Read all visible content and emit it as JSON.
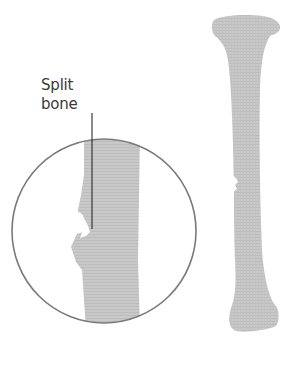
{
  "figure": {
    "callout": {
      "line1": "Split",
      "line2": "bone"
    },
    "colors": {
      "bone": "#c9c9c9",
      "bone_shadow": "#b3b3b3",
      "circle_stroke": "#7a7a7a",
      "leader_line": "#2a2a2a",
      "text": "#3a3a3a",
      "background": "#ffffff"
    },
    "elements": {
      "magnifier": "circle-zoom-inset",
      "whole_bone": "long-bone-with-fracture"
    }
  }
}
